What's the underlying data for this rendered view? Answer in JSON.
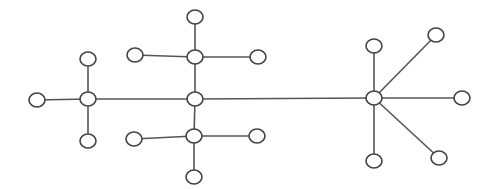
{
  "diagram": {
    "type": "tree-graph",
    "colors": {
      "background": "#ffffff",
      "stroke": "#444444",
      "edge": "#555555",
      "node_fill": "#ffffff"
    },
    "node_radius": {
      "rx": 8,
      "ry": 7
    },
    "nodes": [
      {
        "id": "n1",
        "x": 37,
        "y": 100,
        "role": "leaf"
      },
      {
        "id": "n2",
        "x": 88,
        "y": 99,
        "role": "hub"
      },
      {
        "id": "n3",
        "x": 88,
        "y": 59,
        "role": "leaf"
      },
      {
        "id": "n4",
        "x": 88,
        "y": 141,
        "role": "leaf"
      },
      {
        "id": "n5",
        "x": 195,
        "y": 17,
        "role": "leaf"
      },
      {
        "id": "n6",
        "x": 195,
        "y": 57,
        "role": "hub"
      },
      {
        "id": "n7",
        "x": 135,
        "y": 55,
        "role": "leaf"
      },
      {
        "id": "n8",
        "x": 258,
        "y": 57,
        "role": "leaf"
      },
      {
        "id": "n9",
        "x": 195,
        "y": 99,
        "role": "hub"
      },
      {
        "id": "n10",
        "x": 194,
        "y": 136,
        "role": "hub"
      },
      {
        "id": "n11",
        "x": 134,
        "y": 139,
        "role": "leaf"
      },
      {
        "id": "n12",
        "x": 257,
        "y": 136,
        "role": "leaf"
      },
      {
        "id": "n13",
        "x": 194,
        "y": 177,
        "role": "leaf"
      },
      {
        "id": "n14",
        "x": 374,
        "y": 98,
        "role": "hub"
      },
      {
        "id": "n15",
        "x": 374,
        "y": 46,
        "role": "leaf"
      },
      {
        "id": "n16",
        "x": 436,
        "y": 35,
        "role": "leaf"
      },
      {
        "id": "n17",
        "x": 462,
        "y": 98,
        "role": "leaf"
      },
      {
        "id": "n18",
        "x": 439,
        "y": 158,
        "role": "leaf"
      },
      {
        "id": "n19",
        "x": 374,
        "y": 161,
        "role": "leaf"
      }
    ],
    "edges": [
      [
        "n1",
        "n2"
      ],
      [
        "n2",
        "n3"
      ],
      [
        "n2",
        "n4"
      ],
      [
        "n2",
        "n9"
      ],
      [
        "n5",
        "n6"
      ],
      [
        "n7",
        "n6"
      ],
      [
        "n6",
        "n8"
      ],
      [
        "n6",
        "n9"
      ],
      [
        "n9",
        "n10"
      ],
      [
        "n11",
        "n10"
      ],
      [
        "n10",
        "n12"
      ],
      [
        "n10",
        "n13"
      ],
      [
        "n9",
        "n14"
      ],
      [
        "n14",
        "n15"
      ],
      [
        "n14",
        "n16"
      ],
      [
        "n14",
        "n17"
      ],
      [
        "n14",
        "n18"
      ],
      [
        "n14",
        "n19"
      ]
    ]
  }
}
